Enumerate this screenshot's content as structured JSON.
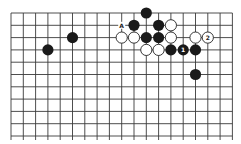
{
  "board": {
    "columns": 19,
    "visible_rows": 11,
    "origin_x": 11,
    "origin_y": 13,
    "spacing": 12.3,
    "stone_radius": 5.6,
    "line_color": "#3a3a3a",
    "black_color": "#1a1a1a",
    "white_color": "#ffffff"
  },
  "stones": [
    {
      "color": "black",
      "col": 11,
      "row": 0,
      "label": ""
    },
    {
      "color": "black",
      "col": 10,
      "row": 1,
      "label": ""
    },
    {
      "color": "black",
      "col": 12,
      "row": 1,
      "label": ""
    },
    {
      "color": "white",
      "col": 13,
      "row": 1,
      "label": ""
    },
    {
      "color": "black",
      "col": 5,
      "row": 2,
      "label": ""
    },
    {
      "color": "white",
      "col": 9,
      "row": 2,
      "label": ""
    },
    {
      "color": "white",
      "col": 10,
      "row": 2,
      "label": ""
    },
    {
      "color": "black",
      "col": 11,
      "row": 2,
      "label": ""
    },
    {
      "color": "black",
      "col": 12,
      "row": 2,
      "label": ""
    },
    {
      "color": "white",
      "col": 13,
      "row": 2,
      "label": ""
    },
    {
      "color": "white",
      "col": 15,
      "row": 2,
      "label": ""
    },
    {
      "color": "white",
      "col": 16,
      "row": 2,
      "label": "2"
    },
    {
      "color": "black",
      "col": 3,
      "row": 3,
      "label": ""
    },
    {
      "color": "white",
      "col": 11,
      "row": 3,
      "label": ""
    },
    {
      "color": "white",
      "col": 12,
      "row": 3,
      "label": ""
    },
    {
      "color": "black",
      "col": 13,
      "row": 3,
      "label": ""
    },
    {
      "color": "black",
      "col": 14,
      "row": 3,
      "label": "1"
    },
    {
      "color": "black",
      "col": 15,
      "row": 3,
      "label": ""
    },
    {
      "color": "black",
      "col": 15,
      "row": 5,
      "label": ""
    }
  ],
  "markers": [
    {
      "text": "A",
      "col": 9,
      "row": 1
    }
  ]
}
